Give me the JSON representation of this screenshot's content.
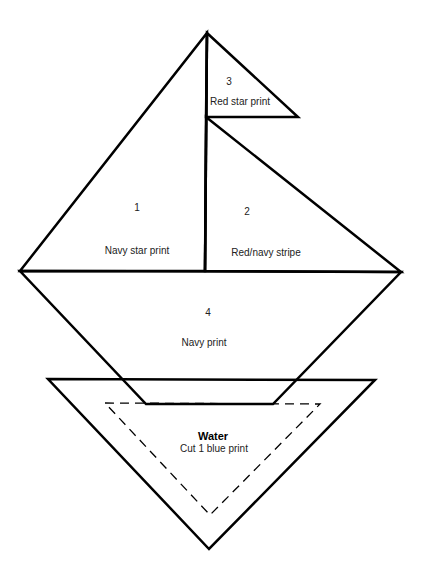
{
  "diagram": {
    "type": "quilt-block-pattern",
    "stroke_color": "#000000",
    "background_color": "#ffffff",
    "pieces": [
      {
        "number": "3",
        "fabric": "Red star print",
        "shape": "triangle",
        "role": "flag"
      },
      {
        "number": "1",
        "fabric": "Navy star print",
        "shape": "triangle",
        "role": "left sail"
      },
      {
        "number": "2",
        "fabric": "Red/navy stripe",
        "shape": "triangle",
        "role": "right sail"
      },
      {
        "number": "4",
        "fabric": "Navy print",
        "shape": "trapezoid",
        "role": "hull"
      }
    ],
    "water": {
      "title": "Water",
      "instruction": "Cut 1 blue print",
      "shape": "inverted triangle",
      "seam_allowance": "dashed inner triangle"
    }
  }
}
